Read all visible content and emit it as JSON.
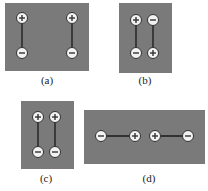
{
  "figure": {
    "colors": {
      "panel": "#7a7a7a",
      "charge_fill": "#f2f2f2",
      "charge_stroke": "#333333",
      "rod": "#1a1a1a"
    },
    "panels": [
      {
        "id": "a",
        "label": "(a)",
        "dipoles": [
          {
            "top": "+",
            "bottom": "−"
          },
          {
            "top": "+",
            "bottom": "−"
          }
        ],
        "orientation": "vertical, far apart, parallel"
      },
      {
        "id": "b",
        "label": "(b)",
        "dipoles": [
          {
            "top": "+",
            "bottom": "−"
          },
          {
            "top": "−",
            "bottom": "+"
          }
        ],
        "orientation": "vertical, side by side, antiparallel"
      },
      {
        "id": "c",
        "label": "(c)",
        "dipoles": [
          {
            "top": "+",
            "bottom": "−"
          },
          {
            "top": "+",
            "bottom": "−"
          }
        ],
        "orientation": "vertical, side by side, parallel"
      },
      {
        "id": "d",
        "label": "(d)",
        "dipoles": [
          {
            "left": "−",
            "right": "+"
          },
          {
            "left": "+",
            "right": "−"
          }
        ],
        "orientation": "horizontal, in line, head to head"
      }
    ]
  }
}
